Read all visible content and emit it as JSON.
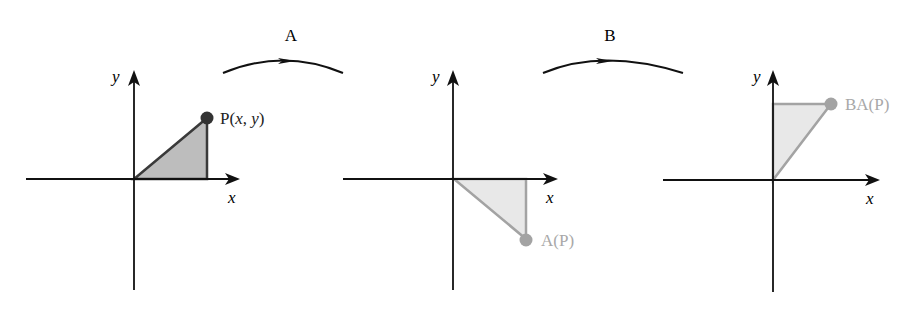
{
  "transforms": [
    {
      "label": "A"
    },
    {
      "label": "B"
    }
  ],
  "panels": [
    {
      "name": "original",
      "x_axis_label": "x",
      "y_axis_label": "y",
      "point_label_prefix": "P(",
      "point_label_x": "x",
      "point_label_sep": ", ",
      "point_label_y": "y",
      "point_label_suffix": ")",
      "point": [
        1,
        1
      ],
      "triangle": [
        [
          0,
          0
        ],
        [
          1,
          0
        ],
        [
          1,
          1
        ]
      ],
      "color": "#333333",
      "fill": "#b8b8b8"
    },
    {
      "name": "after-A",
      "x_axis_label": "x",
      "y_axis_label": "y",
      "point_label": "A(P)",
      "point": [
        1,
        -1
      ],
      "triangle": [
        [
          0,
          0
        ],
        [
          1,
          0
        ],
        [
          1,
          -1
        ]
      ],
      "color": "#a0a0a0",
      "fill": "#e6e6e6"
    },
    {
      "name": "after-BA",
      "x_axis_label": "x",
      "y_axis_label": "y",
      "point_label": "BA(P)",
      "point": [
        1,
        1
      ],
      "triangle": [
        [
          0,
          0
        ],
        [
          0,
          1
        ],
        [
          1,
          1
        ]
      ],
      "color": "#a0a0a0",
      "fill": "#e6e6e6"
    }
  ]
}
